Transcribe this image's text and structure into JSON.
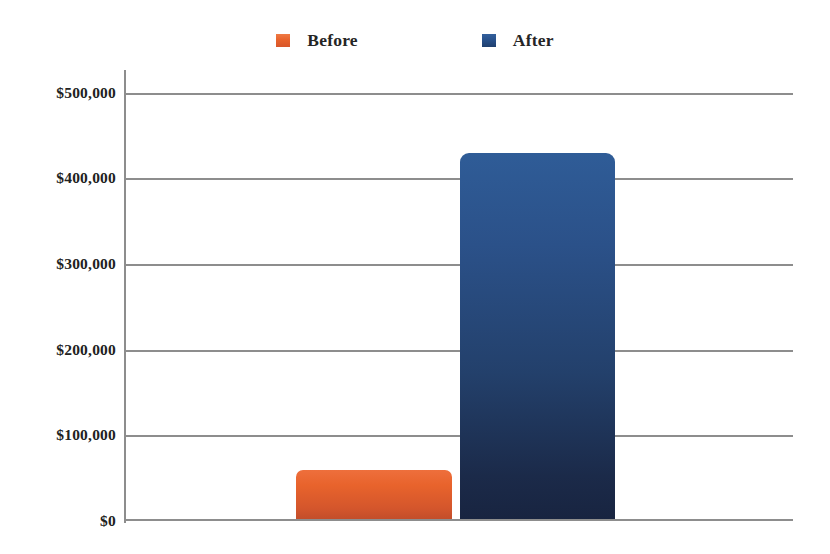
{
  "chart_data": {
    "type": "bar",
    "title": "",
    "subtitle": "",
    "xlabel": "",
    "ylabel": "",
    "categories": [
      ""
    ],
    "series": [
      {
        "name": "Before",
        "values": [
          60000
        ],
        "color": "#e8632c"
      },
      {
        "name": "After",
        "values": [
          430000
        ],
        "color": "#28518b"
      }
    ],
    "ylim": [
      0,
      500000
    ],
    "ytick_values": [
      0,
      100000,
      200000,
      300000,
      400000,
      500000
    ],
    "ytick_labels": [
      "$0",
      "$100,000",
      "$200,000",
      "$300,000",
      "$400,000",
      "$500,000"
    ],
    "grid": true,
    "grid_axis": "y",
    "legend": {
      "position": "top-center",
      "entries": [
        {
          "label": "Before",
          "swatch": "before-swatch",
          "color": "#e8632c"
        },
        {
          "label": "After",
          "swatch": "after-swatch",
          "color": "#28518b"
        }
      ]
    },
    "axis_color": "#8d8d8d",
    "background": "#ffffff"
  },
  "ticks": {
    "t0": "$0",
    "t1": "$100,000",
    "t2": "$200,000",
    "t3": "$300,000",
    "t4": "$400,000",
    "t5": "$500,000"
  },
  "legend": {
    "before_label": "Before",
    "after_label": "After"
  }
}
